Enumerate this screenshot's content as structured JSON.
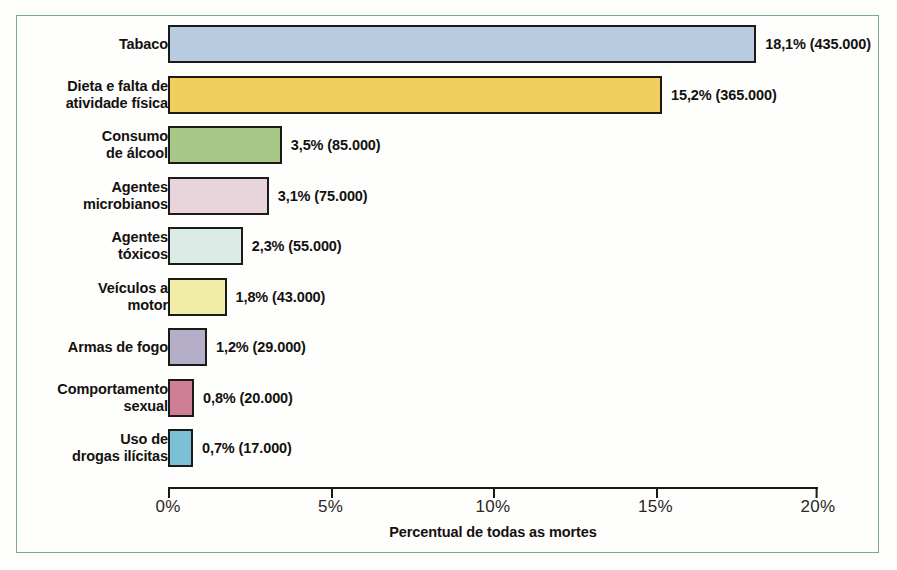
{
  "figure": {
    "frame_color": "#7fa894",
    "background": "#fdfdfc"
  },
  "chart_data": {
    "type": "bar",
    "orientation": "horizontal",
    "title": "",
    "subtitle": "",
    "xlabel": "Percentual de todas as mortes",
    "ylabel": "",
    "xlim": [
      0,
      20
    ],
    "xticks": [
      0,
      5,
      10,
      15,
      20
    ],
    "xtick_labels": [
      "0%",
      "5%",
      "10%",
      "15%",
      "20%"
    ],
    "grid": false,
    "legend": "none",
    "categories": [
      "Tabaco",
      "Dieta e falta de\natividade física",
      "Consumo\nde álcool",
      "Agentes\nmicrobianos",
      "Agentes\ntóxicos",
      "Veículos a\nmotor",
      "Armas de fogo",
      "Comportamento\nsexual",
      "Uso de\ndrogas ilícitas"
    ],
    "values": [
      18.1,
      15.2,
      3.5,
      3.1,
      2.3,
      1.8,
      1.2,
      0.8,
      0.7
    ],
    "counts": [
      435000,
      365000,
      85000,
      75000,
      55000,
      43000,
      29000,
      20000,
      17000
    ],
    "data_labels": [
      "18,1% (435.000)",
      "15,2% (365.000)",
      "3,5% (85.000)",
      "3,1% (75.000)",
      "2,3% (55.000)",
      "1,8% (43.000)",
      "1,2% (29.000)",
      "0,8% (20.000)",
      "0,7% (17.000)"
    ],
    "colors": [
      "#b8cbe0",
      "#f2ce60",
      "#a8c888",
      "#e8d4db",
      "#dcebe6",
      "#f0eda6",
      "#b5aec8",
      "#cf7f95",
      "#7cc0d8"
    ],
    "bar_edge_color": "#1c1a17"
  },
  "rows": [
    {
      "label": "Tabaco",
      "value": "18,1% (435.000)"
    },
    {
      "label": "Dieta e falta de\natividade física",
      "value": "15,2% (365.000)"
    },
    {
      "label": "Consumo\nde álcool",
      "value": "3,5% (85.000)"
    },
    {
      "label": "Agentes\nmicrobianos",
      "value": "3,1% (75.000)"
    },
    {
      "label": "Agentes\ntóxicos",
      "value": "2,3% (55.000)"
    },
    {
      "label": "Veículos a\nmotor",
      "value": "1,8% (43.000)"
    },
    {
      "label": "Armas de fogo",
      "value": "1,2% (29.000)"
    },
    {
      "label": "Comportamento\nsexual",
      "value": "0,8% (20.000)"
    },
    {
      "label": "Uso de\ndrogas ilícitas",
      "value": "0,7% (17.000)"
    }
  ],
  "axis": {
    "ticks": [
      "0%",
      "5%",
      "10%",
      "15%",
      "20%"
    ],
    "title": "Percentual de todas as mortes"
  }
}
